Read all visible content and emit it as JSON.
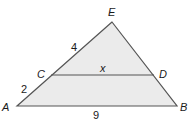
{
  "figure": {
    "type": "triangle-with-midsegment",
    "colors": {
      "fill": "#ebebeb",
      "stroke": "#555555",
      "text": "#1a1a1a"
    },
    "points": {
      "E": {
        "label": "E",
        "x": 112,
        "y": 22
      },
      "A": {
        "label": "A",
        "x": 17,
        "y": 106
      },
      "B": {
        "label": "B",
        "x": 177,
        "y": 106
      },
      "C": {
        "label": "C",
        "x": 51,
        "y": 75
      },
      "D": {
        "label": "D",
        "x": 154,
        "y": 75
      }
    },
    "segment_labels": {
      "EC": "4",
      "CA": "2",
      "CD": "x",
      "AB": "9"
    }
  }
}
